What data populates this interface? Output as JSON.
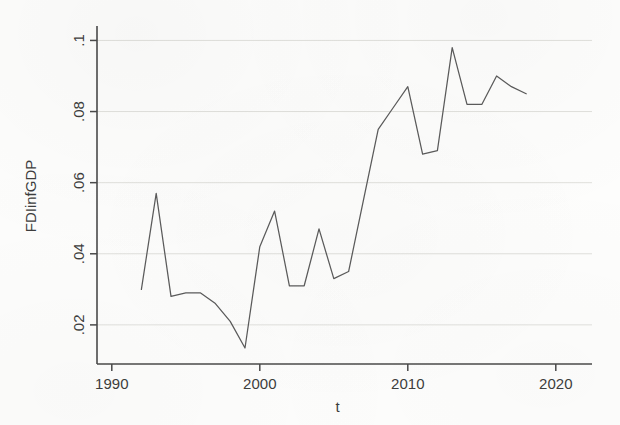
{
  "chart_data": {
    "type": "line",
    "title": "",
    "xlabel": "t",
    "ylabel": "FDIinfGDP",
    "x": [
      1992,
      1993,
      1994,
      1995,
      1996,
      1997,
      1998,
      1999,
      2000,
      2001,
      2002,
      2003,
      2004,
      2005,
      2006,
      2007,
      2008,
      2009,
      2010,
      2011,
      2012,
      2013,
      2014,
      2015,
      2016,
      2017,
      2018
    ],
    "values": [
      0.03,
      0.057,
      0.028,
      0.029,
      0.029,
      0.026,
      0.021,
      0.0135,
      0.042,
      0.052,
      0.031,
      0.031,
      0.047,
      0.033,
      0.035,
      0.055,
      0.075,
      0.081,
      0.087,
      0.068,
      0.069,
      0.098,
      0.082,
      0.082,
      0.09,
      0.087,
      0.085
    ],
    "series": [
      {
        "name": "FDIinfGDP",
        "values": [
          0.03,
          0.057,
          0.028,
          0.029,
          0.029,
          0.026,
          0.021,
          0.0135,
          0.042,
          0.052,
          0.031,
          0.031,
          0.047,
          0.033,
          0.035,
          0.055,
          0.075,
          0.081,
          0.087,
          0.068,
          0.069,
          0.098,
          0.082,
          0.082,
          0.09,
          0.087,
          0.085
        ]
      }
    ],
    "xlim": [
      1989.0,
      2021.5
    ],
    "ylim": [
      0.009,
      0.1035
    ],
    "xticks": [
      1990,
      2000,
      2010,
      2020
    ],
    "xtick_labels": [
      "1990",
      "2000",
      "2010",
      "2020"
    ],
    "yticks": [
      0.02,
      0.04,
      0.06,
      0.08,
      0.1
    ],
    "ytick_labels": [
      ".02",
      ".04",
      ".06",
      ".08",
      ".1"
    ],
    "grid": true,
    "grid_axis": "y",
    "legend": false,
    "legend_position": "none",
    "line_color": "#5b5b5b",
    "grid_color": "#dcdcd8",
    "axis_color": "#4a4a4a",
    "background_color": "#fdfdfc"
  },
  "axis": {
    "x_title": "t",
    "y_title": "FDIinfGDP"
  }
}
